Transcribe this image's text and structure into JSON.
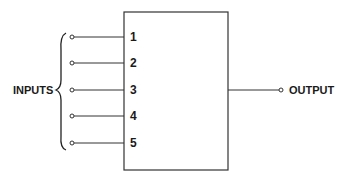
{
  "diagram": {
    "inputs_label": "INPUTS",
    "output_label": "OUTPUT",
    "input_pins": [
      "1",
      "2",
      "3",
      "4",
      "5"
    ],
    "colors": {
      "stroke": "#333333",
      "text": "#1a1a1a"
    }
  }
}
